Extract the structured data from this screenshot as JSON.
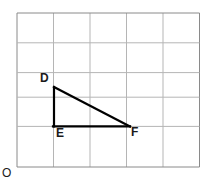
{
  "figure": {
    "background_color": "#ffffff",
    "grid": {
      "color": "#b5b5b5",
      "border_color": "#8a8a8a",
      "line_width": 1,
      "columns": 5,
      "rows": 5,
      "x0": 17,
      "y0": 13,
      "cell_width": 36.5,
      "cell_height": 29.8,
      "x_lines": [
        17,
        53.5,
        90,
        126.5,
        163,
        199.5
      ],
      "y_lines": [
        13,
        42.8,
        72.6,
        97.2,
        126.4,
        167
      ]
    },
    "shape": {
      "name": "triangle-DEF",
      "stroke_color": "#000000",
      "stroke_width": 2.2,
      "fill": "none",
      "vertices": [
        {
          "id": "D",
          "label": "D",
          "x": 54,
          "y": 87
        },
        {
          "id": "E",
          "label": "E",
          "x": 54,
          "y": 126
        },
        {
          "id": "F",
          "label": "F",
          "x": 129,
          "y": 126
        }
      ],
      "edges": [
        {
          "from": "D",
          "to": "E",
          "name": "leg-DE"
        },
        {
          "from": "E",
          "to": "F",
          "name": "leg-EF"
        },
        {
          "from": "F",
          "to": "D",
          "name": "hypotenuse-FD"
        }
      ]
    },
    "labels": {
      "D": "D",
      "E": "E",
      "F": "F",
      "origin": "O"
    }
  }
}
